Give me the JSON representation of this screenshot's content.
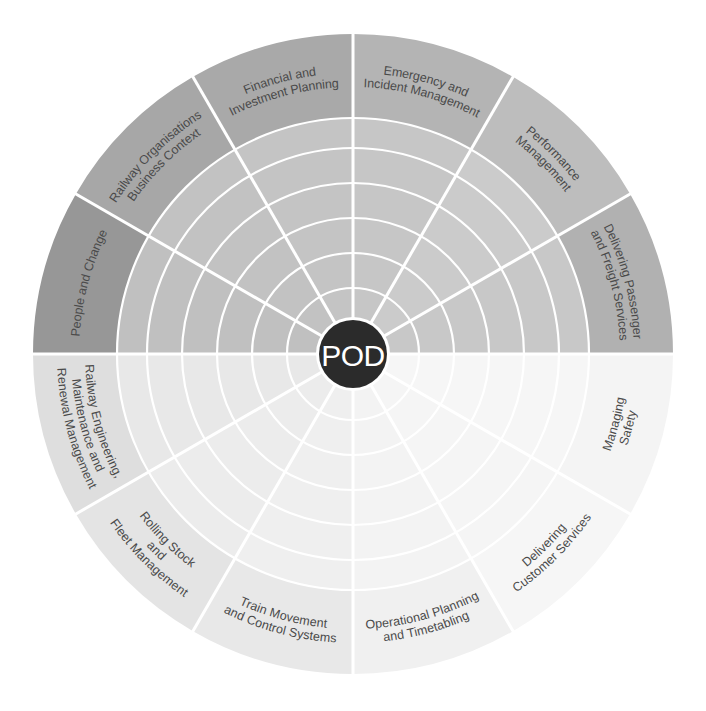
{
  "diagram": {
    "title": "POD",
    "center": {
      "x": 353,
      "y": 354
    },
    "radius": {
      "outer": 320,
      "band_inner": 236,
      "hub": 34
    },
    "rings": [
      66,
      101,
      136,
      171,
      206
    ],
    "colors": {
      "hub": "#2b2b2b",
      "divider": "#ffffff",
      "top_band": "#a9a9a9",
      "top_inner": "#c3c3c3",
      "top_band_dark": "#979797",
      "bottom_band": "#e9e9e9",
      "bottom_inner": "#f3f3f3",
      "label_text": "#4a4a4a"
    },
    "segments": [
      {
        "id": "emergency",
        "start": 0,
        "lines": [
          "Emergency and",
          "Incident Management"
        ],
        "band": "#b4b4b4",
        "inner": "#c6c6c6"
      },
      {
        "id": "performance",
        "start": 30,
        "lines": [
          "Performance",
          "Management"
        ],
        "band": "#bdbdbd",
        "inner": "#cbcbcb"
      },
      {
        "id": "passenger",
        "start": 60,
        "lines": [
          "Delivering Passenger",
          "and Freight Services"
        ],
        "band": "#b1b1b1",
        "inner": "#c8c8c8"
      },
      {
        "id": "safety",
        "start": 90,
        "lines": [
          "Managing",
          "Safety"
        ],
        "band": "#f4f4f4",
        "inner": "#f6f6f6"
      },
      {
        "id": "customer",
        "start": 120,
        "lines": [
          "Delivering",
          "Customer Services"
        ],
        "band": "#f6f6f6",
        "inner": "#f5f5f5"
      },
      {
        "id": "operational",
        "start": 150,
        "lines": [
          "Operational Planning",
          "and Timetabling"
        ],
        "band": "#f0f0f0",
        "inner": "#f3f3f3"
      },
      {
        "id": "train-movement",
        "start": 180,
        "lines": [
          "Train Movement",
          "and Control Systems"
        ],
        "band": "#e8e8e8",
        "inner": "#efefef"
      },
      {
        "id": "rolling-stock",
        "start": 210,
        "lines": [
          "Rolling Stock",
          "and",
          "Fleet Management"
        ],
        "band": "#e4e4e4",
        "inner": "#ececec"
      },
      {
        "id": "engineering",
        "start": 240,
        "lines": [
          "Railway Engineering,",
          "Maintenance and",
          "Renewal Management"
        ],
        "band": "#dedede",
        "inner": "#e8e8e8"
      },
      {
        "id": "people",
        "start": 270,
        "lines": [
          "People and Change"
        ],
        "band": "#979797",
        "inner": "#c0c0c0"
      },
      {
        "id": "organisations",
        "start": 300,
        "lines": [
          "Railway Organisations",
          "Business Context"
        ],
        "band": "#a7a7a7",
        "inner": "#c2c2c2"
      },
      {
        "id": "financial",
        "start": 330,
        "lines": [
          "Financial and",
          "Investment Planning"
        ],
        "band": "#a9a9a9",
        "inner": "#c4c4c4"
      }
    ]
  }
}
